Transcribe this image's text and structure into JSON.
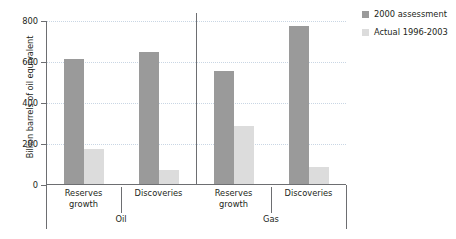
{
  "chart_data": {
    "type": "bar",
    "title": "",
    "xlabel": "",
    "ylabel": "Billion barrels of oil equivalent",
    "ylim": [
      0,
      800
    ],
    "yticks": [
      0,
      200,
      400,
      600,
      800
    ],
    "ytick_labels": [
      "0",
      "200",
      "400",
      "600",
      "800"
    ],
    "grid": "horizontal-dotted",
    "legend_position": "top-right",
    "categories": [
      "Reserves growth",
      "Discoveries",
      "Reserves growth",
      "Discoveries"
    ],
    "category_lines": [
      [
        "Reserves",
        "growth"
      ],
      [
        "Discoveries"
      ],
      [
        "Reserves",
        "growth"
      ],
      [
        "Discoveries"
      ]
    ],
    "groups": [
      {
        "label": "Oil",
        "categories": [
          "Reserves growth",
          "Discoveries"
        ]
      },
      {
        "label": "Gas",
        "categories": [
          "Reserves growth",
          "Discoveries"
        ]
      }
    ],
    "series": [
      {
        "name": "2000 assessment",
        "color": "#9a9a9a",
        "values": [
          610,
          645,
          550,
          770
        ]
      },
      {
        "name": "Actual 1996-2003",
        "color": "#dcdcdc",
        "values": [
          170,
          70,
          285,
          85
        ]
      }
    ]
  },
  "legend": {
    "items": [
      {
        "label": "2000 assessment",
        "color": "#9a9a9a"
      },
      {
        "label": "Actual 1996-2003",
        "color": "#dcdcdc"
      }
    ]
  },
  "axes": {
    "y_title": "Billion barrels of oil equivalent",
    "y_tick_labels": [
      "800",
      "600",
      "400",
      "200",
      "0"
    ]
  },
  "colors": {
    "series_2000_assessment": "#9a9a9a",
    "series_actual": "#dcdcdc",
    "axis": "#6d6e71",
    "gridline": "#c9d6e4",
    "text": "#231f20",
    "background": "#ffffff"
  }
}
